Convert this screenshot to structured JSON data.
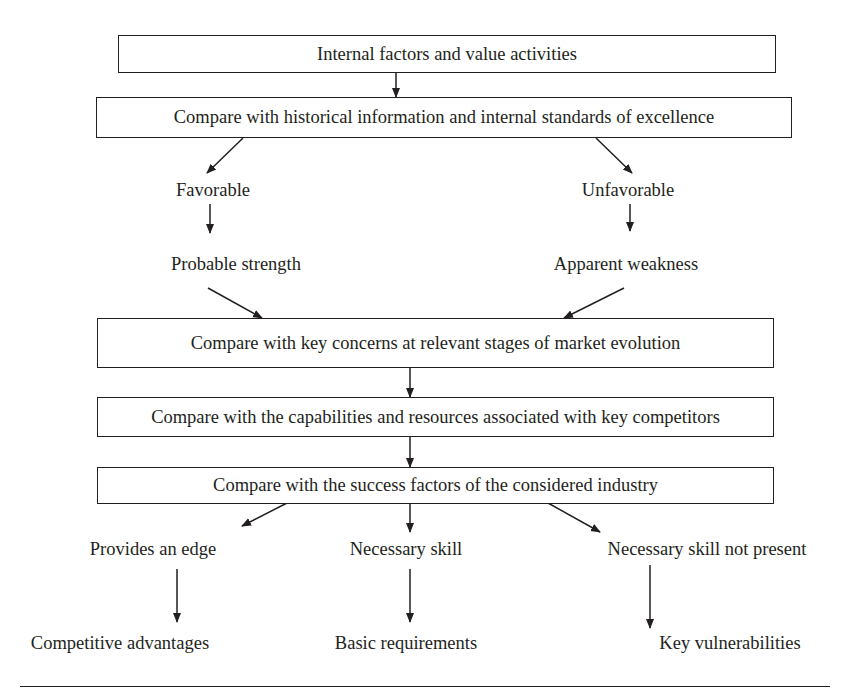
{
  "diagram": {
    "boxes": [
      {
        "id": "internal-factors",
        "text": "Internal factors and value activities"
      },
      {
        "id": "compare-historical",
        "text": "Compare with historical information and internal standards of excellence"
      },
      {
        "id": "compare-market",
        "text": "Compare with key concerns at relevant stages of market evolution"
      },
      {
        "id": "compare-competitors",
        "text": "Compare with the capabilities and resources associated with key competitors"
      },
      {
        "id": "compare-success",
        "text": "Compare with the success factors of the considered industry"
      }
    ],
    "branch1": {
      "favorable": "Favorable",
      "unfavorable": "Unfavorable",
      "probable_strength": "Probable strength",
      "apparent_weakness": "Apparent weakness"
    },
    "branch2": {
      "provides_edge": "Provides an edge",
      "necessary_skill": "Necessary skill",
      "skill_not_present": "Necessary skill not present",
      "competitive_advantages": "Competitive advantages",
      "basic_requirements": "Basic requirements",
      "key_vulnerabilities": "Key vulnerabilities"
    },
    "colors": {
      "line": "#231f20",
      "background": "#ffffff"
    }
  }
}
